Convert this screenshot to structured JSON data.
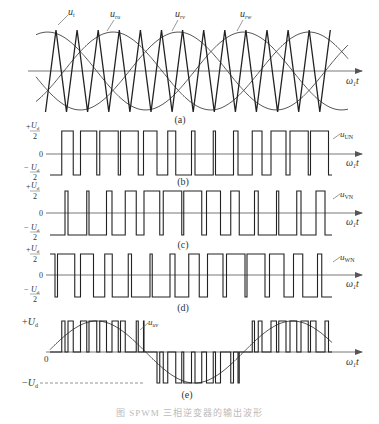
{
  "figure": {
    "caption": "图 SPWM 三相逆变器的输出波形",
    "panels": [
      {
        "id": "a",
        "label": "(a)",
        "title": "carrier and reference waves",
        "signals": [
          "u_t",
          "u_ru",
          "u_rv",
          "u_rw"
        ],
        "signal_labels": {
          "carrier": "u",
          "carrier_sub": "t",
          "ru": "u",
          "ru_sub": "ru",
          "rv": "u",
          "rv_sub": "rv",
          "rw": "u",
          "rw_sub": "rw"
        },
        "x_axis": "ω₁t"
      },
      {
        "id": "b",
        "label": "(b)",
        "signal": "u",
        "signal_sub": "UN",
        "y_top": "+Ud/2",
        "y_zero": "0",
        "y_bottom": "−Ud/2",
        "x_axis": "ω₁t"
      },
      {
        "id": "c",
        "label": "(c)",
        "signal": "u",
        "signal_sub": "VN",
        "y_top": "+Ud/2",
        "y_zero": "0",
        "y_bottom": "−Ud/2",
        "x_axis": "ω₁t"
      },
      {
        "id": "d",
        "label": "(d)",
        "signal": "u",
        "signal_sub": "WN",
        "y_top": "+Ud/2",
        "y_zero": "0",
        "y_bottom": "−Ud/2",
        "x_axis": "ω₁t"
      },
      {
        "id": "e",
        "label": "(e)",
        "signal": "u",
        "signal_sub": "uv",
        "y_top": "+Ud",
        "y_zero": "0",
        "y_bottom": "−Ud",
        "x_axis": "ω₁t"
      }
    ],
    "text": {
      "axis": "ω",
      "axis_sub": "1",
      "axis_t": "t",
      "U": "U",
      "d": "d",
      "plus": "+",
      "minus": "−",
      "two": "2",
      "zero": "0"
    }
  },
  "params": {
    "x_start": 50,
    "x_end": 332,
    "carrier_cycles": 13,
    "carrier_first_peak_x": 56,
    "carrier_period_px": 21.1,
    "reference_period_px": 196,
    "reference_amplitude": 0.8,
    "phase_u_deg": 0,
    "phase_v_deg": -120,
    "phase_w_deg": 120,
    "stroke_color": "#2a2a2a",
    "axis_color": "#555555",
    "sine_color": "#444444"
  }
}
